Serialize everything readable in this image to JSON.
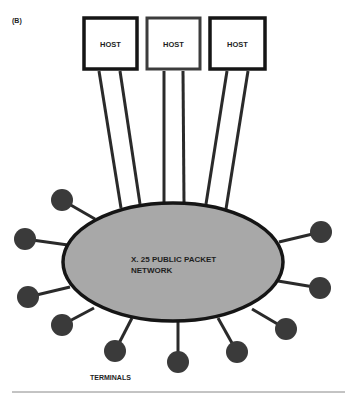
{
  "figure": {
    "label": "(B)",
    "colors": {
      "ink": "#1e1e1e",
      "network_fill": "#a8a8a8",
      "terminal_fill": "#3a3a3a",
      "host_fill": "#ffffff",
      "background": "#ffffff"
    }
  },
  "hosts": [
    {
      "label": "HOST"
    },
    {
      "label": "HOST"
    },
    {
      "label": "HOST"
    }
  ],
  "network": {
    "line1": "X. 25 PUBLIC PACKET",
    "line2": "NETWORK"
  },
  "terminals": {
    "label": "TERMINALS",
    "count": 10
  }
}
